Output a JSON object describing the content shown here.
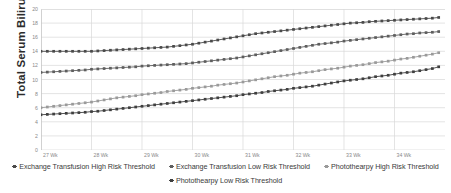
{
  "chart_data": {
    "type": "line",
    "title": "",
    "xlabel": "",
    "ylabel": "Total Serum Bilirubin (mg/dL)",
    "ylim": [
      0,
      20
    ],
    "yticks": [
      0,
      2,
      4,
      6,
      8,
      10,
      12,
      14,
      16,
      18,
      20
    ],
    "xticks": [
      "27 Wk",
      "28 Wk",
      "29 Wk",
      "30 Wk",
      "31 Wk",
      "32 Wk",
      "33 Wk",
      "34 Wk"
    ],
    "xlim": [
      27,
      35
    ],
    "grid": true,
    "legend_position": "bottom",
    "x": [
      27,
      27.125,
      27.25,
      27.375,
      27.5,
      27.625,
      27.75,
      27.875,
      28,
      28.125,
      28.25,
      28.375,
      28.5,
      28.625,
      28.75,
      28.875,
      29,
      29.125,
      29.25,
      29.375,
      29.5,
      29.625,
      29.75,
      29.875,
      30,
      30.125,
      30.25,
      30.375,
      30.5,
      30.625,
      30.75,
      30.875,
      31,
      31.125,
      31.25,
      31.375,
      31.5,
      31.625,
      31.75,
      31.875,
      32,
      32.125,
      32.25,
      32.375,
      32.5,
      32.625,
      32.75,
      32.875,
      33,
      33.125,
      33.25,
      33.375,
      33.5,
      33.625,
      33.75,
      33.875,
      34,
      34.125,
      34.25,
      34.375,
      34.5,
      34.625,
      34.75,
      34.875
    ],
    "series": [
      {
        "name": "Exchange Transfusion High Risk Threshold",
        "color": "#4a4a4a",
        "values": [
          14.0,
          14.0,
          14.0,
          14.0,
          14.0,
          14.0,
          14.0,
          14.0,
          14.0,
          14.05,
          14.1,
          14.15,
          14.2,
          14.25,
          14.3,
          14.35,
          14.4,
          14.45,
          14.5,
          14.55,
          14.6,
          14.7,
          14.8,
          14.9,
          15.0,
          15.15,
          15.3,
          15.45,
          15.6,
          15.75,
          15.9,
          16.05,
          16.2,
          16.35,
          16.5,
          16.6,
          16.7,
          16.8,
          16.9,
          17.0,
          17.1,
          17.2,
          17.3,
          17.4,
          17.5,
          17.6,
          17.7,
          17.8,
          17.9,
          18.0,
          18.05,
          18.1,
          18.2,
          18.25,
          18.3,
          18.35,
          18.4,
          18.45,
          18.5,
          18.55,
          18.6,
          18.65,
          18.7,
          18.8
        ]
      },
      {
        "name": "Exchange Transfusion Low Risk Threshold",
        "color": "#5e5e5e",
        "values": [
          11.0,
          11.05,
          11.1,
          11.15,
          11.2,
          11.25,
          11.3,
          11.35,
          11.45,
          11.5,
          11.55,
          11.6,
          11.65,
          11.7,
          11.75,
          11.8,
          11.9,
          11.95,
          12.0,
          12.05,
          12.1,
          12.15,
          12.2,
          12.25,
          12.35,
          12.45,
          12.55,
          12.65,
          12.75,
          12.85,
          12.95,
          13.05,
          13.2,
          13.35,
          13.5,
          13.65,
          13.8,
          13.95,
          14.1,
          14.25,
          14.4,
          14.55,
          14.7,
          14.85,
          15.0,
          15.1,
          15.2,
          15.3,
          15.45,
          15.55,
          15.65,
          15.75,
          15.85,
          15.95,
          16.05,
          16.15,
          16.25,
          16.35,
          16.45,
          16.5,
          16.6,
          16.65,
          16.7,
          16.8
        ]
      },
      {
        "name": "Photothearpy High Risk Threshold",
        "color": "#9a9a9a",
        "values": [
          6.0,
          6.1,
          6.2,
          6.3,
          6.4,
          6.5,
          6.6,
          6.7,
          6.8,
          6.95,
          7.1,
          7.25,
          7.4,
          7.5,
          7.6,
          7.7,
          7.85,
          7.95,
          8.05,
          8.15,
          8.3,
          8.4,
          8.5,
          8.6,
          8.75,
          8.85,
          8.95,
          9.05,
          9.2,
          9.3,
          9.4,
          9.5,
          9.65,
          9.8,
          9.95,
          10.1,
          10.25,
          10.4,
          10.5,
          10.6,
          10.75,
          10.9,
          11.0,
          11.1,
          11.25,
          11.4,
          11.5,
          11.6,
          11.75,
          11.9,
          12.0,
          12.1,
          12.25,
          12.4,
          12.5,
          12.6,
          12.75,
          12.9,
          13.0,
          13.15,
          13.3,
          13.45,
          13.6,
          13.8
        ]
      },
      {
        "name": "Photothearpy Low Risk Threshold",
        "color": "#3f3f3f",
        "values": [
          5.0,
          5.05,
          5.1,
          5.15,
          5.2,
          5.25,
          5.3,
          5.35,
          5.45,
          5.5,
          5.6,
          5.7,
          5.8,
          5.9,
          6.0,
          6.1,
          6.2,
          6.3,
          6.4,
          6.5,
          6.6,
          6.7,
          6.8,
          6.9,
          7.0,
          7.1,
          7.2,
          7.3,
          7.4,
          7.5,
          7.6,
          7.7,
          7.85,
          7.95,
          8.05,
          8.15,
          8.3,
          8.4,
          8.5,
          8.6,
          8.75,
          8.85,
          8.95,
          9.05,
          9.2,
          9.35,
          9.5,
          9.65,
          9.8,
          9.9,
          10.0,
          10.1,
          10.25,
          10.4,
          10.5,
          10.6,
          10.75,
          10.9,
          11.0,
          11.1,
          11.25,
          11.4,
          11.55,
          11.8
        ]
      }
    ]
  },
  "legend": {
    "rows": [
      [
        "Exchange Transfusion High Risk Threshold",
        "Exchange Transfusion Low Risk Threshold",
        "Photothearpy High Risk Threshold"
      ],
      [
        "Photothearpy Low Risk Threshold"
      ]
    ]
  },
  "colors": {
    "grid": "#d9d9d9",
    "axis_text": "#8a8a8a",
    "title_text": "#2b2b2b",
    "plot_background": "#ffffff"
  }
}
